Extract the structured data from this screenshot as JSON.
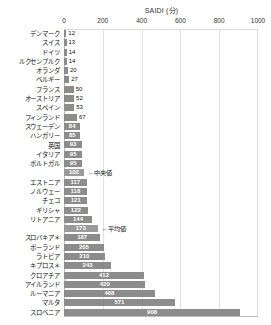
{
  "chart_data": {
    "type": "bar",
    "orientation": "horizontal",
    "title": "SAIDI (分)",
    "xlabel": "",
    "ylabel": "",
    "xlim": [
      0,
      1000
    ],
    "ticks": [
      0,
      200,
      400,
      600,
      800,
      1000
    ],
    "grid": true,
    "legend": null,
    "bar_color": "#8c8c8c",
    "stat_bar_color": "#9a9a9a",
    "categories": [
      "デンマーク",
      "スイス",
      "ドイツ",
      "ルクセンブルク",
      "オランダ",
      "ベルギー",
      "フランス",
      "オーストリア",
      "スペイン",
      "フィンランド",
      "スウェーデン",
      "ハンガリー",
      "英国",
      "イタリア",
      "ポルトガル",
      "",
      "エストニア",
      "ノルウェー",
      "チェコ",
      "ギリシャ",
      "リトアニア",
      "",
      "スロバキア＊",
      "ポーランド",
      "ラトビア",
      "キプロス＊",
      "クロアチア",
      "アイルランド",
      "ルーマニア",
      "マルタ",
      "スロベニア"
    ],
    "values": [
      12,
      13,
      14,
      14,
      20,
      27,
      50,
      52,
      53,
      67,
      84,
      85,
      93,
      95,
      95,
      102,
      117,
      118,
      121,
      122,
      144,
      173,
      187,
      205,
      210,
      243,
      412,
      420,
      468,
      571,
      908
    ],
    "annotations": [
      {
        "row": 15,
        "text": "←中央値"
      },
      {
        "row": 21,
        "text": "←平均値"
      }
    ],
    "stat_rows": [
      15,
      21
    ]
  },
  "axis": {
    "tick_labels": [
      "0",
      "200",
      "400",
      "600",
      "800",
      "1000"
    ]
  }
}
